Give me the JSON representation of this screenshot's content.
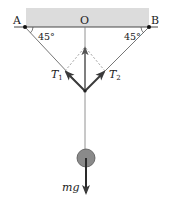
{
  "diagram": {
    "type": "force-diagram",
    "ceiling": {
      "fill": "#dcdcdc",
      "edge": "#333333"
    },
    "points": {
      "A": {
        "label": "A"
      },
      "B": {
        "label": "B"
      },
      "O": {
        "label": "O"
      }
    },
    "angles": {
      "left": "45°",
      "right": "45°"
    },
    "forces": {
      "T1": {
        "label": "T",
        "subscript": "1"
      },
      "T2": {
        "label": "T",
        "subscript": "2"
      },
      "weight": {
        "label": "mg"
      }
    },
    "colors": {
      "string": "#555555",
      "arrow": "#444444",
      "dashed": "#777777",
      "mass": "#8a8a8a",
      "mass_edge": "#555555"
    }
  }
}
